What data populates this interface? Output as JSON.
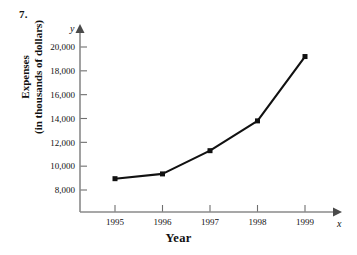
{
  "figure": {
    "problem_number": "7.",
    "x_axis_title": "Year",
    "y_axis_title_line1": "Expenses",
    "y_axis_title_line2": "(in thousands of dollars)",
    "x_axis_variable": "x",
    "y_axis_variable": "y"
  },
  "chart_data": {
    "type": "line",
    "title": "",
    "subtitle": "",
    "xlabel": "Year",
    "ylabel": "Expenses (in thousands of dollars)",
    "categories": [
      "1995",
      "1996",
      "1997",
      "1998",
      "1999"
    ],
    "x": [
      1995,
      1996,
      1997,
      1998,
      1999
    ],
    "values": [
      8950,
      9350,
      11300,
      13800,
      19200
    ],
    "series": [
      {
        "name": "Expenses",
        "values": [
          8950,
          9350,
          11300,
          13800,
          19200
        ]
      }
    ],
    "xlim": [
      1994.4,
      1999.6
    ],
    "ylim": [
      7000,
      20600
    ],
    "ytick_labels": [
      "8,000",
      "10,000",
      "12,000",
      "14,000",
      "16,000",
      "18,000",
      "20,000"
    ],
    "ytick_values": [
      8000,
      10000,
      12000,
      14000,
      16000,
      18000,
      20000
    ],
    "xtick_labels": [
      "1995",
      "1996",
      "1997",
      "1998",
      "1999"
    ],
    "grid": false,
    "legend": "none",
    "marker": "filled-square",
    "line_color": "#111111",
    "marker_color": "#111111",
    "axis_color": "#8a8a8a"
  }
}
